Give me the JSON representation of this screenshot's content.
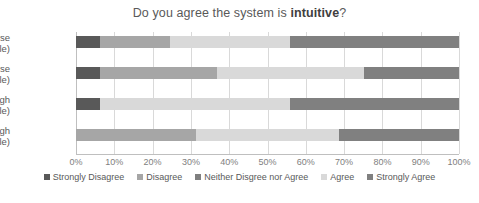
{
  "chart_data": {
    "type": "bar",
    "subtype": "100% stacked horizontal bar",
    "title": "Do you agree the system is intuitive?",
    "title_prefix": "Do you agree the system is ",
    "title_emphasis": "intuitive",
    "title_suffix": "?",
    "xlabel": "",
    "ylabel": "",
    "xlim": [
      0,
      100
    ],
    "xtick_labels": [
      "0%",
      "10%",
      "20%",
      "30%",
      "40%",
      "50%",
      "60%",
      "70%",
      "80%",
      "90%",
      "100%"
    ],
    "xtick_values": [
      0,
      10,
      20,
      30,
      40,
      50,
      60,
      70,
      80,
      90,
      100
    ],
    "grid": true,
    "legend_position": "bottom",
    "categories": [
      "VirtualHorse (Visible)",
      "VirtualHorse (Invisible)",
      "SeeThrough (Visible)",
      "SeeThrough (Invisible)"
    ],
    "category_lines": [
      [
        "VirtualHorse",
        "(Visible)"
      ],
      [
        "VirtualHorse",
        "(Invisible)"
      ],
      [
        "SeeThrough",
        "(Visible)"
      ],
      [
        "SeeThrough",
        "(Invisible)"
      ]
    ],
    "series": [
      {
        "name": "Strongly Disagree",
        "color": "#595959",
        "values": [
          6.3,
          6.3,
          6.3,
          0
        ]
      },
      {
        "name": "Disagree",
        "color": "#a6a6a6",
        "values": [
          18.2,
          30.6,
          0,
          31.3
        ]
      },
      {
        "name": "Neither Disgree nor Agree",
        "color": "#7f7f7f",
        "values": [
          0,
          0,
          0,
          0
        ]
      },
      {
        "name": "Agree",
        "color": "#d9d9d9",
        "values": [
          31.4,
          38.3,
          49.6,
          37.3
        ]
      },
      {
        "name": "Strongly Agree",
        "color": "#808080",
        "values": [
          44.1,
          24.8,
          44.1,
          31.4
        ]
      }
    ]
  },
  "legend": {
    "items": [
      {
        "label": "Strongly Disagree",
        "color": "#595959"
      },
      {
        "label": "Disagree",
        "color": "#a6a6a6"
      },
      {
        "label": "Neither Disgree nor Agree",
        "color": "#7f7f7f"
      },
      {
        "label": "Agree",
        "color": "#d9d9d9"
      },
      {
        "label": "Strongly Agree",
        "color": "#808080"
      }
    ]
  },
  "colors": {
    "background": "#ffffff",
    "text": "#595959",
    "tick_text": "#808080",
    "gridline": "#d9d9d9",
    "axis": "#bfbfbf"
  }
}
